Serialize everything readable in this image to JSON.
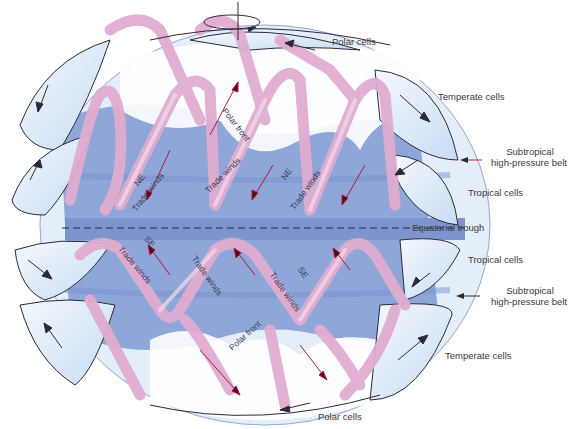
{
  "diagram": {
    "colors": {
      "background": "#ffffff",
      "earth_band": "#8fa6d8",
      "earth_band_dark": "#7890c8",
      "cell_fill": "#dbe9f8",
      "cell_edge": "#9aa3d6",
      "ribbon": "#e6b7d4",
      "ribbon_light": "#f2d6e6",
      "outline": "#2a2a3a",
      "arrow_red": "#c0203a",
      "label_text": "#3a3a3a"
    },
    "rotation_icon": "rotation-axis-arrow",
    "labels": {
      "polar_cells_top": "Polar cells",
      "temperate_cells_top": "Temperate cells",
      "subtropical_top_line1": "Subtropical",
      "subtropical_top_line2": "high-pressure belt",
      "tropical_cells_top": "Tropical cells",
      "equatorial_trough": "Equatorial trough",
      "tropical_cells_bottom": "Tropical cells",
      "subtropical_bottom_line1": "Subtropical",
      "subtropical_bottom_line2": "high-pressure belt",
      "temperate_cells_bottom": "Temperate cells",
      "polar_cells_bottom": "Polar cells"
    },
    "inner_labels": {
      "polar_front_north": "Polar front",
      "polar_front_south": "Polar front",
      "ne_1": "NE",
      "trade_winds_1": "Trade winds",
      "trade_winds_2": "Trade winds",
      "ne_2": "NE",
      "trade_winds_3": "Trade winds",
      "se_1": "SE",
      "trade_winds_4": "Trade winds",
      "trade_winds_5": "Trade winds",
      "se_2": "SE",
      "trade_winds_6": "Trade winds"
    }
  }
}
